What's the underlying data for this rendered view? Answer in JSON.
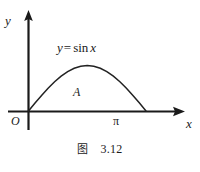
{
  "figure": {
    "axes": {
      "y_axis_label": "y",
      "x_axis_label": "x",
      "origin_label": "O"
    },
    "ticks": {
      "x": [
        {
          "label": "π",
          "value": 3.14159
        }
      ]
    },
    "equation": {
      "lhs": "y",
      "operator": "=",
      "function": "sin",
      "argument": "x",
      "full": "y = sin x"
    },
    "region_label": "A",
    "caption": {
      "word": "图",
      "number": "3.12"
    },
    "colors": {
      "ink": "#1a1a1a",
      "background": "#ffffff",
      "curve": "#222222"
    }
  },
  "chart_data": {
    "type": "line",
    "title": "",
    "subtitle": "",
    "xlabel": "x",
    "ylabel": "y",
    "xlim": [
      -0.35,
      4.3
    ],
    "ylim": [
      -0.32,
      1.55
    ],
    "grid": false,
    "legend": null,
    "annotations": [
      {
        "text": "y = sin x",
        "x": 1.05,
        "y": 1.32
      },
      {
        "text": "A",
        "x": 1.6,
        "y": 0.4
      }
    ],
    "series": [
      {
        "name": "y = sin x",
        "kind": "curve",
        "domain": [
          0,
          3.14159
        ],
        "x": [
          0.0,
          0.1745,
          0.3491,
          0.5236,
          0.6981,
          0.8727,
          1.0472,
          1.2217,
          1.3963,
          1.5708,
          1.7453,
          1.9199,
          2.0944,
          2.2689,
          2.4435,
          2.618,
          2.7925,
          2.9671,
          3.1416
        ],
        "y": [
          0.0,
          0.1736,
          0.342,
          0.5,
          0.6428,
          0.766,
          0.866,
          0.9397,
          0.9848,
          1.0,
          0.9848,
          0.9397,
          0.866,
          0.766,
          0.6428,
          0.5,
          0.342,
          0.1736,
          0.0
        ]
      }
    ],
    "shaded_region": {
      "label": "A",
      "from": 0,
      "to": 3.14159,
      "filled": false
    },
    "xticks": [
      {
        "value": 3.14159,
        "label": "π"
      }
    ],
    "yticks": []
  }
}
